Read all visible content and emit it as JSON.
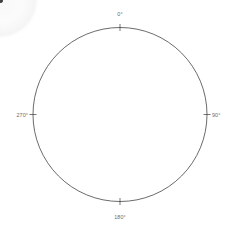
{
  "figure": {
    "type": "pole-figure",
    "title": "",
    "background": "#ffffff",
    "outline_color": "#3a3a3a",
    "label_color": "#6b6b6b"
  },
  "axis": {
    "labels": [
      {
        "name": "north",
        "text": "0°",
        "angle_deg": 0
      },
      {
        "name": "east",
        "text": "90°",
        "angle_deg": 90
      },
      {
        "name": "south",
        "text": "180°",
        "angle_deg": 180
      },
      {
        "name": "west",
        "text": "270°",
        "angle_deg": 270
      }
    ]
  },
  "chart_data": {
    "type": "scatter",
    "title": "",
    "xlabel": "",
    "ylabel": "",
    "projection": "polar-stereographic",
    "grid": false,
    "legend": null,
    "outer_circle": {
      "cx": 120,
      "cy": 114.5,
      "r": 87
    },
    "angular_ticks": [
      0,
      90,
      180,
      270
    ],
    "angular_tick_labels": [
      "0°",
      "90°",
      "180°",
      "270°"
    ],
    "radial_range": [
      0,
      90
    ],
    "point_color": "#4a4a4a",
    "cloud": {
      "center": {
        "cx": 121,
        "cy": 119
      },
      "mean_radius": 37,
      "description": "ring-shaped density of poles near radius 37 px"
    },
    "points": [
      {
        "a": 2,
        "r": 35,
        "s": 1.0,
        "o": 0.35
      },
      {
        "a": 6,
        "r": 37,
        "s": 1.3,
        "o": 0.45
      },
      {
        "a": 9,
        "r": 36,
        "s": 1.1,
        "o": 0.3
      },
      {
        "a": 13,
        "r": 38,
        "s": 1.6,
        "o": 0.55
      },
      {
        "a": 16,
        "r": 37,
        "s": 1.2,
        "o": 0.4
      },
      {
        "a": 20,
        "r": 39,
        "s": 1.8,
        "o": 0.6
      },
      {
        "a": 24,
        "r": 38,
        "s": 2.0,
        "o": 0.65
      },
      {
        "a": 27,
        "r": 37,
        "s": 1.4,
        "o": 0.45
      },
      {
        "a": 31,
        "r": 38,
        "s": 2.2,
        "o": 0.7
      },
      {
        "a": 34,
        "r": 39,
        "s": 2.4,
        "o": 0.72
      },
      {
        "a": 38,
        "r": 38,
        "s": 2.0,
        "o": 0.62
      },
      {
        "a": 42,
        "r": 37,
        "s": 1.6,
        "o": 0.5
      },
      {
        "a": 46,
        "r": 38,
        "s": 1.4,
        "o": 0.42
      },
      {
        "a": 52,
        "r": 37,
        "s": 1.2,
        "o": 0.35
      },
      {
        "a": 58,
        "r": 38,
        "s": 1.5,
        "o": 0.45
      },
      {
        "a": 63,
        "r": 36,
        "s": 1.2,
        "o": 0.33
      },
      {
        "a": 69,
        "r": 37,
        "s": 1.8,
        "o": 0.55
      },
      {
        "a": 74,
        "r": 36,
        "s": 1.3,
        "o": 0.38
      },
      {
        "a": 80,
        "r": 35,
        "s": 1.1,
        "o": 0.3
      },
      {
        "a": 86,
        "r": 36,
        "s": 1.5,
        "o": 0.44
      },
      {
        "a": 92,
        "r": 35,
        "s": 1.2,
        "o": 0.34
      },
      {
        "a": 99,
        "r": 36,
        "s": 1.6,
        "o": 0.48
      },
      {
        "a": 106,
        "r": 35,
        "s": 1.3,
        "o": 0.36
      },
      {
        "a": 112,
        "r": 36,
        "s": 1.9,
        "o": 0.58
      },
      {
        "a": 118,
        "r": 37,
        "s": 1.4,
        "o": 0.4
      },
      {
        "a": 124,
        "r": 36,
        "s": 1.1,
        "o": 0.28
      },
      {
        "a": 131,
        "r": 37,
        "s": 1.7,
        "o": 0.52
      },
      {
        "a": 137,
        "r": 38,
        "s": 2.1,
        "o": 0.62
      },
      {
        "a": 142,
        "r": 39,
        "s": 2.6,
        "o": 0.74
      },
      {
        "a": 146,
        "r": 38,
        "s": 2.3,
        "o": 0.66
      },
      {
        "a": 150,
        "r": 37,
        "s": 1.8,
        "o": 0.54
      },
      {
        "a": 155,
        "r": 36,
        "s": 1.3,
        "o": 0.36
      },
      {
        "a": 161,
        "r": 37,
        "s": 1.1,
        "o": 0.3
      },
      {
        "a": 168,
        "r": 36,
        "s": 1.4,
        "o": 0.4
      },
      {
        "a": 175,
        "r": 35,
        "s": 1.2,
        "o": 0.32
      },
      {
        "a": 182,
        "r": 36,
        "s": 1.5,
        "o": 0.44
      },
      {
        "a": 189,
        "r": 37,
        "s": 1.2,
        "o": 0.33
      },
      {
        "a": 196,
        "r": 36,
        "s": 1.6,
        "o": 0.47
      },
      {
        "a": 203,
        "r": 37,
        "s": 1.3,
        "o": 0.36
      },
      {
        "a": 210,
        "r": 36,
        "s": 1.1,
        "o": 0.28
      },
      {
        "a": 217,
        "r": 37,
        "s": 1.4,
        "o": 0.42
      },
      {
        "a": 223,
        "r": 38,
        "s": 1.2,
        "o": 0.32
      },
      {
        "a": 230,
        "r": 37,
        "s": 1.5,
        "o": 0.45
      },
      {
        "a": 236,
        "r": 36,
        "s": 1.3,
        "o": 0.35
      },
      {
        "a": 242,
        "r": 37,
        "s": 1.7,
        "o": 0.5
      },
      {
        "a": 248,
        "r": 38,
        "s": 1.4,
        "o": 0.4
      },
      {
        "a": 254,
        "r": 37,
        "s": 1.9,
        "o": 0.56
      },
      {
        "a": 259,
        "r": 38,
        "s": 2.4,
        "o": 0.7
      },
      {
        "a": 263,
        "r": 39,
        "s": 2.8,
        "o": 0.78
      },
      {
        "a": 266,
        "r": 39,
        "s": 3.0,
        "o": 0.8
      },
      {
        "a": 269,
        "r": 38,
        "s": 2.6,
        "o": 0.72
      },
      {
        "a": 272,
        "r": 39,
        "s": 2.9,
        "o": 0.76
      },
      {
        "a": 275,
        "r": 38,
        "s": 2.5,
        "o": 0.68
      },
      {
        "a": 278,
        "r": 39,
        "s": 2.2,
        "o": 0.62
      },
      {
        "a": 282,
        "r": 38,
        "s": 1.8,
        "o": 0.52
      },
      {
        "a": 286,
        "r": 37,
        "s": 1.5,
        "o": 0.44
      },
      {
        "a": 291,
        "r": 38,
        "s": 1.9,
        "o": 0.56
      },
      {
        "a": 296,
        "r": 37,
        "s": 1.4,
        "o": 0.4
      },
      {
        "a": 301,
        "r": 38,
        "s": 1.2,
        "o": 0.32
      },
      {
        "a": 307,
        "r": 37,
        "s": 1.6,
        "o": 0.46
      },
      {
        "a": 313,
        "r": 38,
        "s": 1.3,
        "o": 0.36
      },
      {
        "a": 319,
        "r": 37,
        "s": 1.1,
        "o": 0.28
      },
      {
        "a": 325,
        "r": 36,
        "s": 1.4,
        "o": 0.4
      },
      {
        "a": 331,
        "r": 37,
        "s": 1.2,
        "o": 0.32
      },
      {
        "a": 337,
        "r": 36,
        "s": 1.6,
        "o": 0.46
      },
      {
        "a": 343,
        "r": 37,
        "s": 1.3,
        "o": 0.35
      },
      {
        "a": 349,
        "r": 36,
        "s": 1.1,
        "o": 0.28
      },
      {
        "a": 355,
        "r": 35,
        "s": 1.4,
        "o": 0.4
      },
      {
        "a": 40,
        "r": 30,
        "s": 0.8,
        "o": 0.18
      },
      {
        "a": 95,
        "r": 28,
        "s": 0.7,
        "o": 0.15
      },
      {
        "a": 160,
        "r": 26,
        "s": 0.8,
        "o": 0.16
      },
      {
        "a": 215,
        "r": 29,
        "s": 0.7,
        "o": 0.14
      },
      {
        "a": 300,
        "r": 27,
        "s": 0.8,
        "o": 0.17
      },
      {
        "a": 120,
        "r": 18,
        "s": 0.6,
        "o": 0.12
      },
      {
        "a": 250,
        "r": 15,
        "s": 0.6,
        "o": 0.12
      },
      {
        "a": 10,
        "r": 12,
        "s": 0.5,
        "o": 0.1
      }
    ]
  }
}
